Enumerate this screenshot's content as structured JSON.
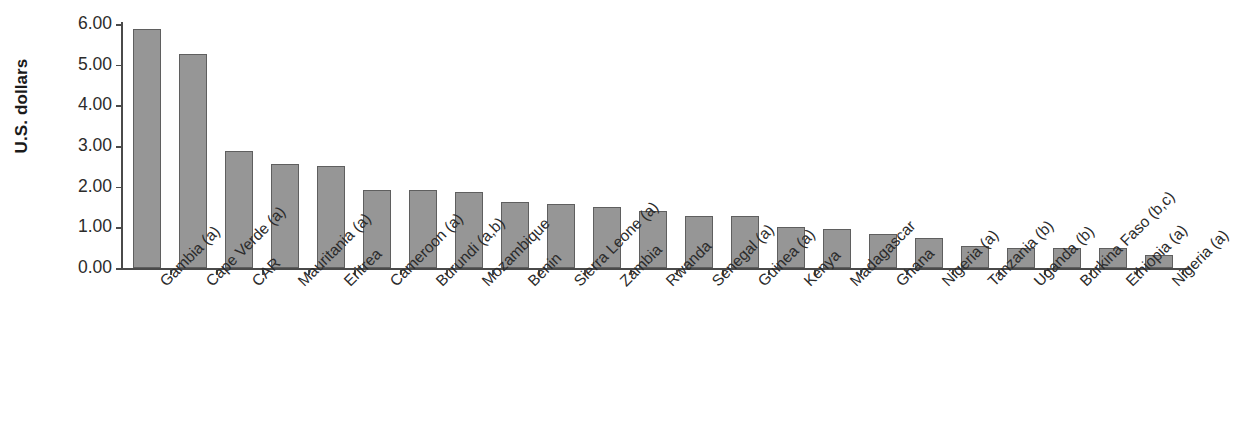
{
  "chart_data": {
    "type": "bar",
    "title": "",
    "xlabel": "",
    "ylabel": "U.S. dollars",
    "ylim": [
      0,
      6
    ],
    "ytick_labels": [
      "6.00",
      "5.00",
      "4.00",
      "3.00",
      "2.00",
      "1.00",
      "0.00"
    ],
    "ytick_values": [
      6,
      5,
      4,
      3,
      2,
      1,
      0
    ],
    "grid": false,
    "legend": false,
    "bar_color": "#969696",
    "bar_border_color": "#5f5f5f",
    "axis_color": "#4a4a4a",
    "categories": [
      "Gambia (a)",
      "Cape Verde (a)",
      "CAR",
      "Mauritania (a)",
      "Eritrea",
      "Cameroon (a)",
      "Burundi (a,b)",
      "Mozambique",
      "Benin",
      "Sierra Leone (a)",
      "Zambia",
      "Rwanda",
      "Senegal (a)",
      "Guinea (a)",
      "Kenya",
      "Madagascar",
      "Ghana",
      "Nigeria (a)",
      "Tanzania (b)",
      "Uganda (b)",
      "Burkina Faso (b,c)",
      "Ethiopia (a)",
      "Nigeria (a)"
    ],
    "values": [
      5.88,
      5.26,
      2.87,
      2.57,
      2.52,
      1.92,
      1.92,
      1.88,
      1.62,
      1.57,
      1.49,
      1.39,
      1.29,
      1.29,
      1.02,
      0.96,
      0.83,
      0.73,
      0.53,
      0.49,
      0.49,
      0.49,
      0.33
    ]
  },
  "axis": {
    "y_title": "U.S. dollars"
  }
}
